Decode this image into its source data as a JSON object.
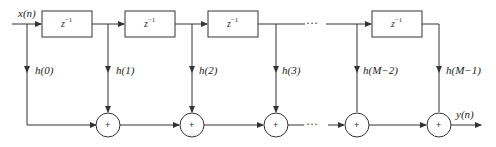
{
  "diagram": {
    "type": "FIR filter direct form",
    "input_label": "x(n)",
    "output_label": "y(n)",
    "delay_label": "z",
    "delay_exponent": "−1",
    "adder_symbol": "+",
    "ellipsis": "···",
    "taps": [
      {
        "label": "h(0)"
      },
      {
        "label": "h(1)"
      },
      {
        "label": "h(2)"
      },
      {
        "label": "h(3)"
      },
      {
        "label": "h(M−2)"
      },
      {
        "label": "h(M−1)"
      }
    ],
    "line_color": "#333333"
  }
}
